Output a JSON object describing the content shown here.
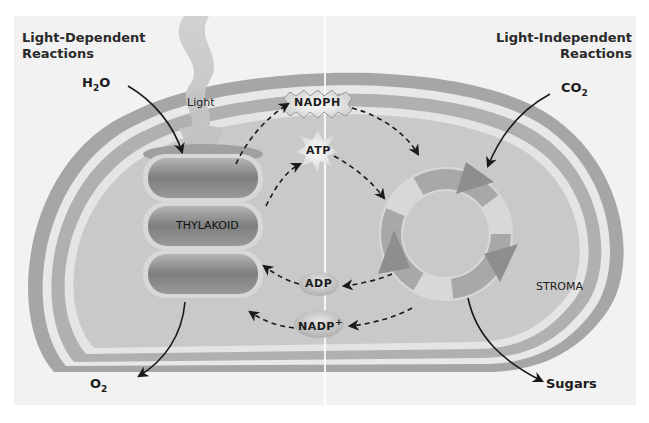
{
  "diagram": {
    "colorScheme": "grayscale",
    "colors": {
      "background": "#f2f2f2",
      "outer_membrane": "#a6a6a6",
      "membrane_gap": "#bdbdbd",
      "membrane_highlight": "#e8e8e8",
      "stroma": "#c9c9c9",
      "thylakoid": "#8c8c8c",
      "cycle_arrow": "#9a9a9a",
      "text": "#1c1c1c"
    },
    "headers": {
      "left": [
        "Light-Dependent",
        "Reactions"
      ],
      "right": [
        "Light-Independent",
        "Reactions"
      ]
    },
    "inputs": {
      "water": {
        "base": "H",
        "sub": "2",
        "tail": "O"
      },
      "carbon_dioxide": {
        "base": "CO",
        "sub": "2"
      },
      "light": "Light"
    },
    "outputs": {
      "oxygen": {
        "base": "O",
        "sub": "2"
      },
      "sugars": "Sugars"
    },
    "structures": {
      "thylakoid": "THYLAKOID",
      "stroma": "STROMA"
    },
    "energy_carriers": {
      "nadph": "NADPH",
      "atp": "ATP",
      "adp": "ADP",
      "nadp_plus": {
        "base": "NADP",
        "sup": "+"
      }
    },
    "flows": [
      {
        "from": "thylakoid",
        "to": "nadph",
        "style": "dashed"
      },
      {
        "from": "nadph",
        "to": "calvin-cycle",
        "style": "dashed"
      },
      {
        "from": "thylakoid",
        "to": "atp",
        "style": "dashed"
      },
      {
        "from": "atp",
        "to": "calvin-cycle",
        "style": "dashed"
      },
      {
        "from": "calvin-cycle",
        "to": "adp",
        "style": "dashed"
      },
      {
        "from": "adp",
        "to": "thylakoid",
        "style": "dashed"
      },
      {
        "from": "calvin-cycle",
        "to": "nadp_plus",
        "style": "dashed"
      },
      {
        "from": "nadp_plus",
        "to": "thylakoid",
        "style": "dashed"
      },
      {
        "from": "water",
        "to": "thylakoid",
        "style": "solid"
      },
      {
        "from": "thylakoid",
        "to": "oxygen",
        "style": "solid"
      },
      {
        "from": "carbon_dioxide",
        "to": "calvin-cycle",
        "style": "solid"
      },
      {
        "from": "calvin-cycle",
        "to": "sugars",
        "style": "solid"
      },
      {
        "from": "light",
        "to": "thylakoid",
        "style": "beam"
      }
    ]
  }
}
